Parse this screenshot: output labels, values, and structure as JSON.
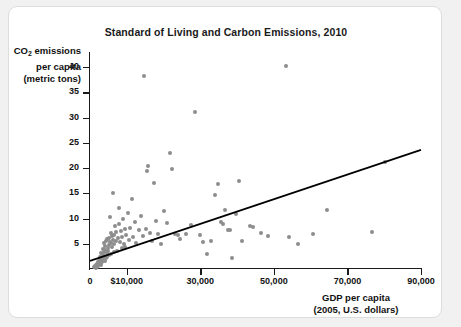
{
  "chart_data": {
    "type": "scatter",
    "title": "Standard of Living and Carbon Emissions, 2010",
    "xlabel_line1": "GDP per capita",
    "xlabel_line2": "(2005, U.S. dollars)",
    "ylabel_line1": "CO2 emissions",
    "ylabel_line2": "per capita",
    "ylabel_line3": "(metric tons)",
    "ylabel_prefix": "CO",
    "ylabel_subscript": "2",
    "ylabel_suffix": " emissions",
    "xlim": [
      0,
      90000
    ],
    "ylim": [
      0,
      43
    ],
    "grid": false,
    "legend": null,
    "xticks": [
      {
        "value": 0,
        "label": "0"
      },
      {
        "value": 10000,
        "label": "$10,000"
      },
      {
        "value": 30000,
        "label": "30,000"
      },
      {
        "value": 50000,
        "label": "50,000"
      },
      {
        "value": 70000,
        "label": "70,000"
      },
      {
        "value": 90000,
        "label": "90,000"
      }
    ],
    "yticks": [
      {
        "value": 5,
        "label": "5"
      },
      {
        "value": 10,
        "label": "10"
      },
      {
        "value": 15,
        "label": "15"
      },
      {
        "value": 20,
        "label": "20"
      },
      {
        "value": 25,
        "label": "25"
      },
      {
        "value": 30,
        "label": "30"
      },
      {
        "value": 35,
        "label": "35"
      },
      {
        "value": 40,
        "label": "40"
      }
    ],
    "marker_color": "#8d8d8d",
    "trend_color": "#000000",
    "trend_line": {
      "x0": 0,
      "y0": 1.6,
      "x1": 90000,
      "y1": 23.6
    },
    "points": [
      [
        1200,
        0.3
      ],
      [
        1400,
        0.5
      ],
      [
        1500,
        0.2
      ],
      [
        1700,
        0.8
      ],
      [
        1900,
        0.4
      ],
      [
        2000,
        1.0
      ],
      [
        2100,
        0.6
      ],
      [
        2300,
        1.3
      ],
      [
        2400,
        0.9
      ],
      [
        2500,
        1.6
      ],
      [
        2600,
        2.0
      ],
      [
        2700,
        1.1
      ],
      [
        2800,
        2.4
      ],
      [
        2900,
        1.8
      ],
      [
        3000,
        3.1
      ],
      [
        3100,
        0.7
      ],
      [
        3200,
        2.2
      ],
      [
        3300,
        1.4
      ],
      [
        3400,
        4.0
      ],
      [
        3500,
        2.8
      ],
      [
        3600,
        1.9
      ],
      [
        3700,
        3.4
      ],
      [
        3800,
        5.2
      ],
      [
        3900,
        2.6
      ],
      [
        4000,
        4.6
      ],
      [
        4100,
        1.5
      ],
      [
        4200,
        3.8
      ],
      [
        4300,
        2.1
      ],
      [
        4400,
        5.6
      ],
      [
        4500,
        3.2
      ],
      [
        4600,
        6.0
      ],
      [
        4700,
        2.3
      ],
      [
        4800,
        4.2
      ],
      [
        4900,
        5.9
      ],
      [
        5000,
        3.6
      ],
      [
        5100,
        6.2
      ],
      [
        5200,
        2.7
      ],
      [
        5300,
        4.8
      ],
      [
        5400,
        10.4
      ],
      [
        5500,
        5.4
      ],
      [
        5600,
        3.0
      ],
      [
        5700,
        7.1
      ],
      [
        5800,
        5.1
      ],
      [
        5900,
        6.5
      ],
      [
        6000,
        4.4
      ],
      [
        6200,
        15.1
      ],
      [
        6300,
        5.8
      ],
      [
        6400,
        3.3
      ],
      [
        6500,
        6.8
      ],
      [
        6600,
        4.9
      ],
      [
        6800,
        8.6
      ],
      [
        7000,
        5.5
      ],
      [
        7200,
        7.4
      ],
      [
        7400,
        3.5
      ],
      [
        7600,
        6.1
      ],
      [
        7800,
        9.0
      ],
      [
        8000,
        12.1
      ],
      [
        8200,
        5.3
      ],
      [
        8400,
        7.6
      ],
      [
        8600,
        4.1
      ],
      [
        8800,
        6.4
      ],
      [
        9000,
        10.0
      ],
      [
        9200,
        5.0
      ],
      [
        9400,
        7.9
      ],
      [
        9600,
        4.3
      ],
      [
        9800,
        6.7
      ],
      [
        10200,
        11.1
      ],
      [
        10600,
        5.7
      ],
      [
        11000,
        8.2
      ],
      [
        11400,
        13.9
      ],
      [
        11800,
        6.3
      ],
      [
        12200,
        9.4
      ],
      [
        12600,
        5.2
      ],
      [
        13200,
        7.7
      ],
      [
        13800,
        10.5
      ],
      [
        14400,
        6.6
      ],
      [
        14800,
        38.2
      ],
      [
        15200,
        8.0
      ],
      [
        15600,
        19.5
      ],
      [
        15800,
        20.4
      ],
      [
        16200,
        7.2
      ],
      [
        16800,
        5.6
      ],
      [
        17400,
        17.1
      ],
      [
        18000,
        9.6
      ],
      [
        18600,
        6.9
      ],
      [
        19200,
        4.9
      ],
      [
        20200,
        11.5
      ],
      [
        21000,
        9.1
      ],
      [
        21800,
        22.9
      ],
      [
        22400,
        19.8
      ],
      [
        23000,
        7.0
      ],
      [
        23800,
        6.8
      ],
      [
        24600,
        5.9
      ],
      [
        26000,
        6.9
      ],
      [
        27400,
        8.7
      ],
      [
        28600,
        31.2
      ],
      [
        29800,
        6.7
      ],
      [
        30800,
        5.3
      ],
      [
        31800,
        2.9
      ],
      [
        33000,
        5.5
      ],
      [
        34000,
        14.6
      ],
      [
        34800,
        16.9
      ],
      [
        35600,
        9.4
      ],
      [
        36200,
        8.9
      ],
      [
        36800,
        11.6
      ],
      [
        37400,
        7.8
      ],
      [
        38000,
        7.8
      ],
      [
        38600,
        2.2
      ],
      [
        39600,
        10.8
      ],
      [
        40400,
        17.5
      ],
      [
        41400,
        5.5
      ],
      [
        43600,
        8.5
      ],
      [
        44200,
        8.4
      ],
      [
        46600,
        7.2
      ],
      [
        48400,
        6.6
      ],
      [
        53400,
        40.2
      ],
      [
        54200,
        6.3
      ],
      [
        56600,
        4.9
      ],
      [
        60600,
        6.9
      ],
      [
        64400,
        11.7
      ],
      [
        76600,
        7.3
      ],
      [
        80200,
        21.2
      ]
    ]
  }
}
